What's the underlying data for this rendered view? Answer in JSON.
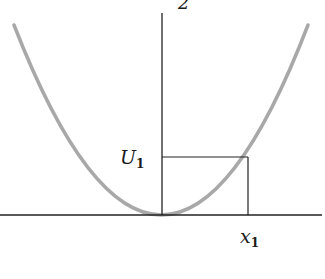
{
  "diagram": {
    "type": "potential-energy-parabola",
    "top_label_fragment": "2",
    "y_marker": {
      "symbol": "U",
      "subscript": "1"
    },
    "x_marker": {
      "symbol": "x",
      "subscript": "1"
    },
    "colors": {
      "curve": "#a8a8a8",
      "axes": "#222222",
      "guides": "#222222",
      "text": "#1a1a1a"
    }
  }
}
